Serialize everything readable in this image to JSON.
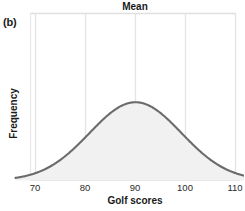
{
  "figure": {
    "panel_label": "(b)",
    "title": "Mean",
    "xlabel": "Golf scores",
    "ylabel": "Frequency"
  },
  "colors": {
    "curve": "#6b6b6b",
    "fill": "#f1f1f1",
    "gridline": "#e3e3e3",
    "axis": "#d9d9d9",
    "text": "#1a1a1a"
  },
  "chart_data": {
    "type": "line",
    "title": "Mean",
    "xlabel": "Golf scores",
    "ylabel": "Frequency",
    "xlim": [
      66,
      114
    ],
    "ylim": [
      0,
      1.08
    ],
    "grid": true,
    "legend": null,
    "distribution": {
      "shape": "normal",
      "mean": 90,
      "std": 9.2,
      "peak_x": 90,
      "shaded_under_curve": true
    },
    "annotations": [
      {
        "label": "Mean",
        "x": 90,
        "position": "top-center"
      }
    ],
    "xticks": [
      70,
      80,
      90,
      100,
      110
    ],
    "xtick_labels": [
      "70",
      "80",
      "90",
      "100",
      "110"
    ],
    "yticks": [],
    "ytick_labels": [],
    "x": [
      66,
      68,
      70,
      72,
      74,
      76,
      78,
      80,
      82,
      84,
      86,
      88,
      90,
      92,
      94,
      96,
      98,
      100,
      102,
      104,
      106,
      108,
      110,
      112,
      114
    ],
    "y": [
      0.01,
      0.02,
      0.04,
      0.07,
      0.12,
      0.19,
      0.29,
      0.41,
      0.55,
      0.7,
      0.84,
      0.96,
      1.0,
      0.96,
      0.84,
      0.7,
      0.55,
      0.41,
      0.29,
      0.19,
      0.12,
      0.07,
      0.04,
      0.02,
      0.01
    ]
  }
}
